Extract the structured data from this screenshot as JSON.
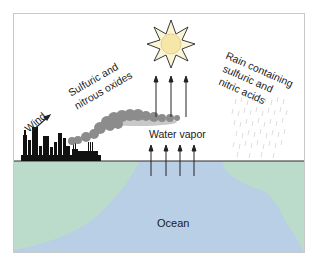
{
  "diagram": {
    "title": "",
    "labels": {
      "wind": "Wind",
      "emissions_line1": "Sulfuric and",
      "emissions_line2": "nitrous oxides",
      "water_vapor": "Water vapor",
      "rain_line1": "Rain containing",
      "rain_line2": "sulfuric and",
      "rain_line3": "nitric acids",
      "ocean": "Ocean"
    },
    "icons": {
      "sun": "sun-icon",
      "factory": "factory-skyline-icon",
      "smoke": "smoke-cloud-icon",
      "rain": "rain-icon",
      "wind_arrow": "arrow-icon",
      "vapor_arrows": "arrow-up-icon"
    },
    "colors": {
      "ocean": "#b9cfe6",
      "land": "#bcdccb",
      "smoke": "#8c8c8c",
      "smoke_light": "#c8c8c8",
      "sun_fill": "#f6e7a9",
      "sun_petals": "#fbf5d8",
      "factory": "#111111",
      "rain": "#d9d9d9",
      "frame": "#c9c9c9"
    }
  }
}
